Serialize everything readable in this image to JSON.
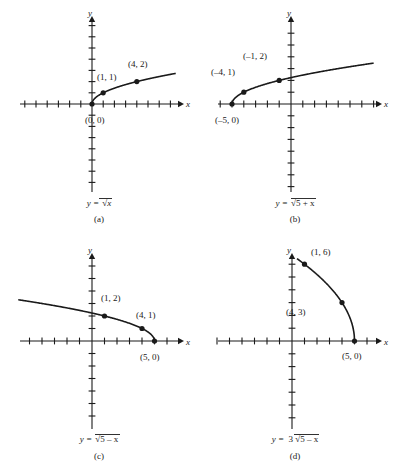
{
  "figure": {
    "background": "#ffffff",
    "ink_color": "#1a1a1a"
  },
  "chart_data": [
    {
      "id": "a",
      "type": "line",
      "title": "y = √x",
      "equation_parts": {
        "lhs": "y =",
        "coefficient": "",
        "radicand": "x"
      },
      "panel_letter": "(a)",
      "xlabel": "x",
      "ylabel": "y",
      "grid": false,
      "legend": "none",
      "xlim": [
        -8,
        8
      ],
      "ylim": [
        -8,
        8
      ],
      "tick_step": 1,
      "domain": [
        0,
        8
      ],
      "points": [
        {
          "label": "(0, 0)",
          "x": 0,
          "y": 0
        },
        {
          "label": "(1, 1)",
          "x": 1,
          "y": 1
        },
        {
          "label": "(4, 2)",
          "x": 4,
          "y": 2
        }
      ],
      "curve": {
        "form": "sqrt",
        "a": 1,
        "h": 0,
        "sign": 1
      }
    },
    {
      "id": "b",
      "type": "line",
      "title": "y = √(5 + x)",
      "equation_parts": {
        "lhs": "y =",
        "coefficient": "",
        "radicand": "5 + x"
      },
      "panel_letter": "(b)",
      "xlabel": "x",
      "ylabel": "y",
      "grid": false,
      "legend": "none",
      "xlim": [
        -8,
        8
      ],
      "ylim": [
        -8,
        8
      ],
      "tick_step": 1,
      "domain": [
        -5,
        8
      ],
      "points": [
        {
          "label": "(–5, 0)",
          "x": -5,
          "y": 0
        },
        {
          "label": "(–4, 1)",
          "x": -4,
          "y": 1
        },
        {
          "label": "(–1, 2)",
          "x": -1,
          "y": 2
        }
      ],
      "curve": {
        "form": "sqrt",
        "a": 1,
        "h": -5,
        "sign": 1
      }
    },
    {
      "id": "c",
      "type": "line",
      "title": "y = √(5 – x)",
      "equation_parts": {
        "lhs": "y =",
        "coefficient": "",
        "radicand": "5 – x"
      },
      "panel_letter": "(c)",
      "xlabel": "x",
      "ylabel": "y",
      "grid": false,
      "legend": "none",
      "xlim": [
        -8,
        8
      ],
      "ylim": [
        -8,
        8
      ],
      "tick_step": 1,
      "domain": [
        -8,
        5
      ],
      "points": [
        {
          "label": "(1, 2)",
          "x": 1,
          "y": 2
        },
        {
          "label": "(4, 1)",
          "x": 4,
          "y": 1
        },
        {
          "label": "(5, 0)",
          "x": 5,
          "y": 0
        }
      ],
      "curve": {
        "form": "sqrt",
        "a": 1,
        "h": 5,
        "sign": -1
      }
    },
    {
      "id": "d",
      "type": "line",
      "title": "y = 3√(5 – x)",
      "equation_parts": {
        "lhs": "y =",
        "coefficient": "3",
        "radicand": "5 – x"
      },
      "panel_letter": "(d)",
      "xlabel": "x",
      "ylabel": "y",
      "grid": false,
      "legend": "none",
      "xlim": [
        -8,
        8
      ],
      "ylim": [
        -8,
        8
      ],
      "tick_step": 1,
      "domain": [
        0.4,
        5
      ],
      "points": [
        {
          "label": "(1, 6)",
          "x": 1,
          "y": 6
        },
        {
          "label": "(4, 3)",
          "x": 4,
          "y": 3
        },
        {
          "label": "(5, 0)",
          "x": 5,
          "y": 0
        }
      ],
      "curve": {
        "form": "sqrt",
        "a": 3,
        "h": 5,
        "sign": -1
      }
    }
  ],
  "panels": {
    "a": {
      "point_labels": [
        "(1, 1)",
        "(4, 2)",
        "(0, 0)"
      ],
      "axis_x": "x",
      "axis_y": "y",
      "eq_lhs": "y =",
      "eq_coef": "",
      "eq_radicand": "x",
      "letter": "(a)"
    },
    "b": {
      "point_labels": [
        "(–4, 1)",
        "(–1, 2)",
        "(–5, 0)"
      ],
      "axis_x": "x",
      "axis_y": "y",
      "eq_lhs": "y =",
      "eq_coef": "",
      "eq_radicand": "5 + x",
      "letter": "(b)"
    },
    "c": {
      "point_labels": [
        "(1, 2)",
        "(4, 1)",
        "(5, 0)"
      ],
      "axis_x": "x",
      "axis_y": "y",
      "eq_lhs": "y =",
      "eq_coef": "",
      "eq_radicand": "5 – x",
      "letter": "(c)"
    },
    "d": {
      "point_labels": [
        "(1, 6)",
        "(4, 3)",
        "(5, 0)"
      ],
      "axis_x": "x",
      "axis_y": "y",
      "eq_lhs": "y =",
      "eq_coef": "3",
      "eq_radicand": "5 – x",
      "letter": "(d)"
    }
  }
}
